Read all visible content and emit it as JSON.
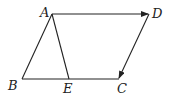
{
  "diagram": {
    "type": "geometry",
    "points": {
      "A": {
        "label": "A",
        "x": 52,
        "y": 14
      },
      "B": {
        "label": "B",
        "x": 22,
        "y": 79
      },
      "C": {
        "label": "C",
        "x": 118,
        "y": 79
      },
      "D": {
        "label": "D",
        "x": 149,
        "y": 14
      },
      "E": {
        "label": "E",
        "x": 69,
        "y": 79
      }
    },
    "segments": [
      {
        "from": "A",
        "to": "D",
        "arrow": true
      },
      {
        "from": "D",
        "to": "C",
        "arrow": true
      },
      {
        "from": "A",
        "to": "B",
        "arrow": false
      },
      {
        "from": "B",
        "to": "C",
        "arrow": false
      },
      {
        "from": "A",
        "to": "E",
        "arrow": false
      }
    ],
    "colors": {
      "stroke": "#222222",
      "background": "#ffffff"
    }
  }
}
